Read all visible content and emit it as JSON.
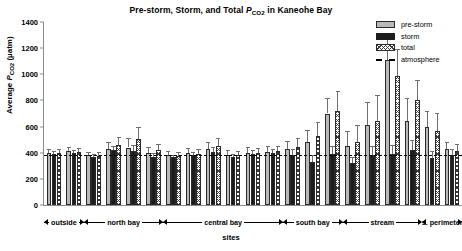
{
  "chart_data": {
    "type": "bar",
    "title": "Pre-storm, Storm, and Total PCO2 in Kaneohe Bay",
    "title_parts": {
      "pre": "Pre-storm, Storm, and Total ",
      "italic": "P",
      "sub": "CO",
      "sub2": "2",
      "post": " in Kaneohe Bay"
    },
    "xlabel": "sites",
    "ylabel": "Average PCO2 (µatm)",
    "ylabel_parts": {
      "pre": "Average ",
      "italic": "P",
      "sub": "CO",
      "sub2": "2",
      "post": " (µatm)"
    },
    "ylim": [
      0,
      1400
    ],
    "yticks": [
      0,
      200,
      400,
      600,
      800,
      1000,
      1200,
      1400
    ],
    "grid": false,
    "legend_position": "top-right",
    "legend": [
      {
        "name": "pre-storm",
        "style": "light-gray-fill"
      },
      {
        "name": "storm",
        "style": "black-fill"
      },
      {
        "name": "total",
        "style": "hatched-fill"
      },
      {
        "name": "atmosphere",
        "style": "black-dashed-line"
      }
    ],
    "reference_line": {
      "name": "atmosphere",
      "value": 380
    },
    "categories": [
      "1",
      "2",
      "3",
      "4",
      "5",
      "6",
      "7",
      "8",
      "9",
      "10",
      "11",
      "12",
      "13",
      "14",
      "15",
      "16",
      "17",
      "18",
      "19",
      "20",
      "21"
    ],
    "groups": [
      {
        "label": "outside",
        "start": 0,
        "end": 1
      },
      {
        "label": "north bay",
        "start": 2,
        "end": 5
      },
      {
        "label": "central bay",
        "start": 6,
        "end": 11
      },
      {
        "label": "south bay",
        "start": 12,
        "end": 14
      },
      {
        "label": "stream",
        "start": 15,
        "end": 18
      },
      {
        "label": "s. perimeter",
        "start": 19,
        "end": 20
      }
    ],
    "series": [
      {
        "name": "pre-storm",
        "values": [
          400,
          410,
          380,
          425,
          440,
          395,
          380,
          395,
          430,
          385,
          400,
          405,
          430,
          480,
          700,
          455,
          610,
          1110,
          640,
          600,
          425
        ],
        "errors": [
          30,
          35,
          28,
          55,
          70,
          45,
          30,
          40,
          55,
          35,
          40,
          45,
          60,
          95,
          120,
          110,
          180,
          190,
          180,
          120,
          60
        ]
      },
      {
        "name": "storm",
        "values": [
          390,
          395,
          370,
          420,
          415,
          370,
          365,
          380,
          405,
          370,
          390,
          400,
          385,
          330,
          390,
          320,
          380,
          390,
          420,
          360,
          385
        ],
        "errors": [
          20,
          25,
          20,
          35,
          45,
          25,
          20,
          25,
          35,
          22,
          28,
          30,
          40,
          55,
          60,
          45,
          70,
          70,
          75,
          55,
          40
        ]
      },
      {
        "name": "total",
        "values": [
          398,
          405,
          378,
          460,
          505,
          420,
          378,
          390,
          455,
          382,
          398,
          410,
          445,
          525,
          720,
          480,
          640,
          990,
          800,
          565,
          410
        ],
        "errors": [
          28,
          32,
          25,
          60,
          95,
          50,
          28,
          35,
          60,
          30,
          38,
          42,
          70,
          110,
          150,
          130,
          200,
          200,
          160,
          140,
          55
        ]
      }
    ]
  }
}
